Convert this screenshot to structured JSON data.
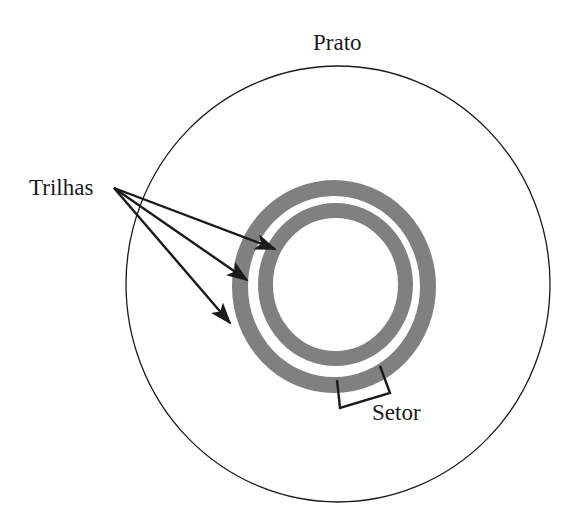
{
  "diagram": {
    "labels": {
      "platter": "Prato",
      "tracks": "Trilhas",
      "sector": "Setor"
    },
    "colors": {
      "background": "#ffffff",
      "line": "#1a1a1a",
      "track_fill": "#808080"
    },
    "platter": {
      "cx": 338,
      "cy": 284,
      "rx": 212,
      "ry": 218
    },
    "tracks": [
      {
        "name": "outer-track",
        "cx": 334,
        "cy": 286.5,
        "rx": 94,
        "ry": 98.5,
        "width": 16
      },
      {
        "name": "inner-track",
        "cx": 335.5,
        "cy": 284.5,
        "rx": 70,
        "ry": 74,
        "width": 15
      }
    ],
    "arrows": {
      "origin": [
        114,
        188
      ],
      "targets": [
        [
          275,
          249
        ],
        [
          247,
          280
        ],
        [
          230,
          323
        ]
      ]
    },
    "sector_bracket": [
      [
        380,
        366
      ],
      [
        390,
        393
      ],
      [
        340,
        408
      ],
      [
        337,
        380
      ]
    ]
  }
}
